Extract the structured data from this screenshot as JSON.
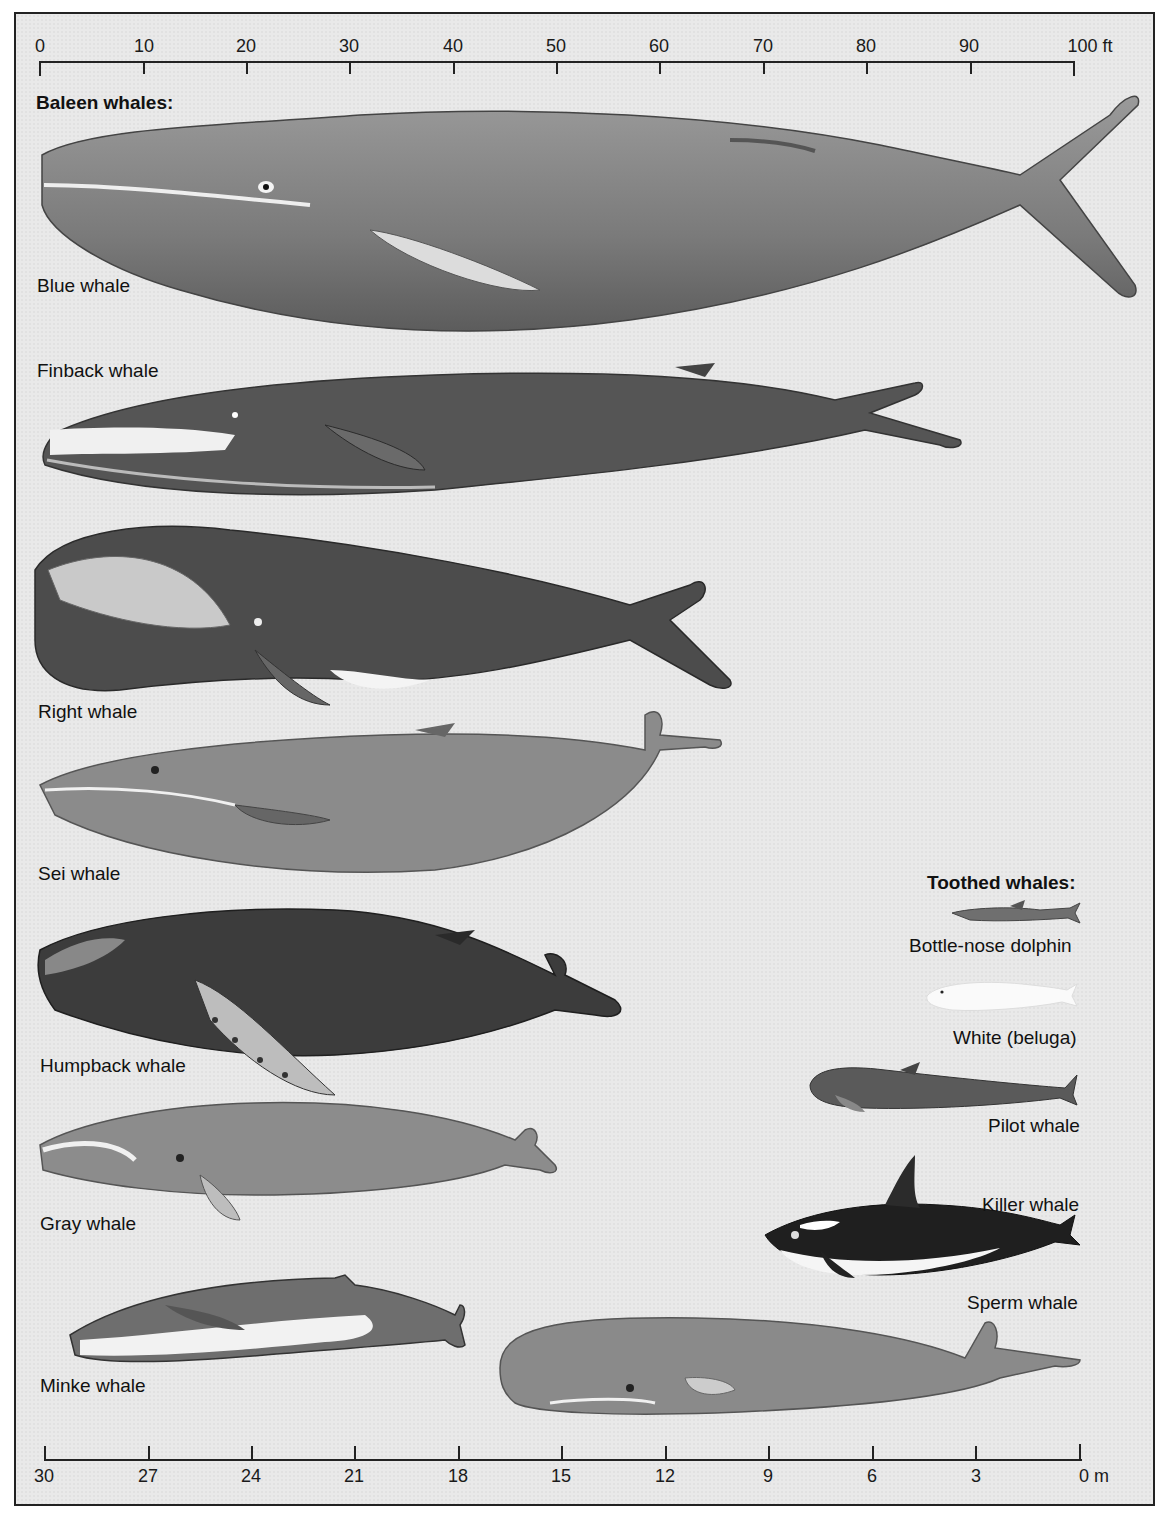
{
  "figure": {
    "background_color": "#e9e9e9",
    "border_color": "#222222"
  },
  "scale_top": {
    "unit": "ft",
    "ticks": [
      "0",
      "10",
      "20",
      "30",
      "40",
      "50",
      "60",
      "70",
      "80",
      "90",
      "100 ft"
    ]
  },
  "scale_bottom": {
    "unit": "m",
    "ticks": [
      "30",
      "27",
      "24",
      "21",
      "18",
      "15",
      "12",
      "9",
      "6",
      "3",
      "0 m"
    ]
  },
  "groups": {
    "baleen": {
      "heading": "Baleen whales:",
      "whales": [
        {
          "name": "Blue whale",
          "approx_length_ft": 100
        },
        {
          "name": "Finback whale",
          "approx_length_ft": 90
        },
        {
          "name": "Right whale",
          "approx_length_ft": 67
        },
        {
          "name": "Sei whale",
          "approx_length_ft": 66
        },
        {
          "name": "Humpback whale",
          "approx_length_ft": 57
        },
        {
          "name": "Gray whale",
          "approx_length_ft": 50
        },
        {
          "name": "Minke whale",
          "approx_length_ft": 40
        }
      ]
    },
    "toothed": {
      "heading": "Toothed whales:",
      "whales": [
        {
          "name": "Bottle-nose dolphin",
          "approx_length_ft": 12
        },
        {
          "name": "White (beluga)",
          "approx_length_ft": 15
        },
        {
          "name": "Pilot whale",
          "approx_length_ft": 26
        },
        {
          "name": "Killer whale",
          "approx_length_ft": 30
        },
        {
          "name": "Sperm whale",
          "approx_length_ft": 57
        }
      ]
    }
  }
}
